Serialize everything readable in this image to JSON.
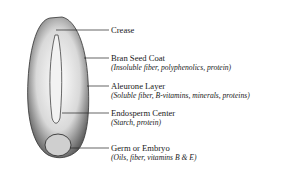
{
  "diagram": {
    "labels": [
      {
        "name": "Crease",
        "detail": ""
      },
      {
        "name": "Bran Seed Coat",
        "detail": "(Insoluble fiber, polyphenolics, protein)"
      },
      {
        "name": "Aleurone Layer",
        "detail": "(Soluble fiber, B-vitamins, minerals, proteins)"
      },
      {
        "name": "Endosperm Center",
        "detail": "(Starch, protein)"
      },
      {
        "name": "Germ or Embryo",
        "detail": "(Oils, fiber, vitamins B & E)"
      }
    ]
  }
}
